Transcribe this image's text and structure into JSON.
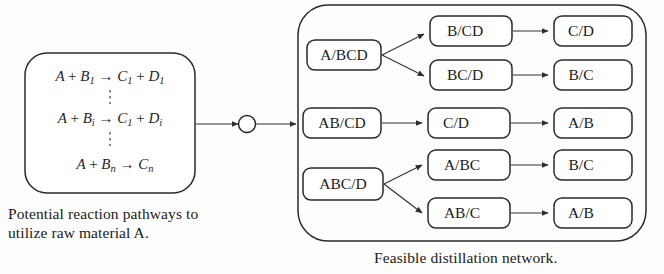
{
  "figure": {
    "background_color": "#fdfdfc",
    "line_color": "#2a2a2a"
  },
  "reaction_box": {
    "name": "potential-reaction-pathways-box",
    "equations": [
      {
        "id": "eq1",
        "lhs_species": "A",
        "plus": "+",
        "reactant": "B",
        "reactant_sub": "1",
        "arrow": "→",
        "product1": "C",
        "product1_sub": "1",
        "plus2": "+",
        "product2": "D",
        "product2_sub": "1",
        "full_text": "A + B1 → C1 + D1"
      },
      {
        "id": "eq2",
        "lhs_species": "A",
        "plus": "+",
        "reactant": "B",
        "reactant_sub": "i",
        "arrow": "→",
        "product1": "C",
        "product1_sub": "1",
        "plus2": "+",
        "product2": "D",
        "product2_sub": "i",
        "full_text": "A + Bi → C1 + Di"
      },
      {
        "id": "eq3",
        "lhs_species": "A",
        "plus": "+",
        "reactant": "B",
        "reactant_sub": "n",
        "arrow": "→",
        "product1": "C",
        "product1_sub": "n",
        "plus2": "",
        "product2": "",
        "product2_sub": "",
        "full_text": "A + Bn → Cn"
      }
    ],
    "vertical_ellipsis_count": 2
  },
  "captions": {
    "left": "Potential reaction pathways to\nutilize raw material A.",
    "right": "Feasible distillation network."
  },
  "connector": {
    "name": "process-node-circle",
    "shape": "circle",
    "from": "reaction-box",
    "to": "distillation-network"
  },
  "network": {
    "name": "feasible-distillation-network",
    "columns": [
      {
        "id": "col1",
        "nodes": [
          {
            "id": "n-abcd",
            "label": "A/BCD",
            "x": 307,
            "y": 40,
            "w": 74,
            "h": 30
          },
          {
            "id": "n-ab-cd",
            "label": "AB/CD",
            "x": 303,
            "y": 108,
            "w": 78,
            "h": 30
          },
          {
            "id": "n-abc-d",
            "label": "ABC/D",
            "x": 303,
            "y": 168,
            "w": 80,
            "h": 32
          }
        ]
      },
      {
        "id": "col2",
        "nodes": [
          {
            "id": "n-b-cd",
            "label": "B/CD",
            "x": 430,
            "y": 16,
            "w": 82,
            "h": 30
          },
          {
            "id": "n-bc-d",
            "label": "BC/D",
            "x": 430,
            "y": 60,
            "w": 82,
            "h": 30
          },
          {
            "id": "n-c-d-mid",
            "label": "C/D",
            "x": 428,
            "y": 108,
            "w": 82,
            "h": 30
          },
          {
            "id": "n-a-bc",
            "label": "A/BC",
            "x": 428,
            "y": 150,
            "w": 82,
            "h": 30
          },
          {
            "id": "n-ab-c",
            "label": "AB/C",
            "x": 428,
            "y": 198,
            "w": 82,
            "h": 30
          }
        ]
      },
      {
        "id": "col3",
        "nodes": [
          {
            "id": "n-c-d-top",
            "label": "C/D",
            "x": 554,
            "y": 16,
            "w": 78,
            "h": 30
          },
          {
            "id": "n-b-c-upper",
            "label": "B/C",
            "x": 554,
            "y": 60,
            "w": 78,
            "h": 30
          },
          {
            "id": "n-a-b-mid",
            "label": "A/B",
            "x": 554,
            "y": 108,
            "w": 78,
            "h": 30
          },
          {
            "id": "n-b-c-lower",
            "label": "B/C",
            "x": 554,
            "y": 150,
            "w": 78,
            "h": 30
          },
          {
            "id": "n-a-b-bottom",
            "label": "A/B",
            "x": 554,
            "y": 198,
            "w": 78,
            "h": 30
          }
        ]
      }
    ],
    "edges": [
      {
        "id": "e1",
        "from": "n-abcd",
        "to": "n-b-cd"
      },
      {
        "id": "e2",
        "from": "n-abcd",
        "to": "n-bc-d"
      },
      {
        "id": "e3",
        "from": "n-b-cd",
        "to": "n-c-d-top"
      },
      {
        "id": "e4",
        "from": "n-bc-d",
        "to": "n-b-c-upper"
      },
      {
        "id": "e5",
        "from": "n-ab-cd",
        "to": "n-c-d-mid"
      },
      {
        "id": "e6",
        "from": "n-c-d-mid",
        "to": "n-a-b-mid"
      },
      {
        "id": "e7",
        "from": "n-abc-d",
        "to": "n-a-bc"
      },
      {
        "id": "e8",
        "from": "n-abc-d",
        "to": "n-ab-c"
      },
      {
        "id": "e9",
        "from": "n-a-bc",
        "to": "n-b-c-lower"
      },
      {
        "id": "e10",
        "from": "n-ab-c",
        "to": "n-a-b-bottom"
      }
    ]
  }
}
